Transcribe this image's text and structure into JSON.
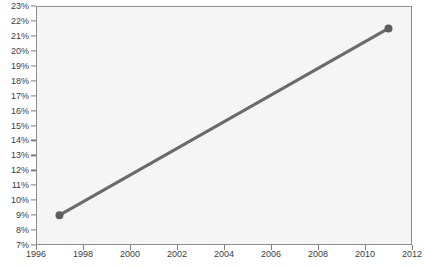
{
  "chart_data": {
    "type": "line",
    "title": "10 YEARS OF MM ACHIEVEMENT",
    "xlabel": "",
    "ylabel": "",
    "x": [
      1997,
      2011
    ],
    "values": [
      9.0,
      21.5
    ],
    "series": [
      {
        "name": "achievement",
        "x": [
          1997,
          2011
        ],
        "values": [
          9.0,
          21.5
        ]
      }
    ],
    "xlim": [
      1996,
      2012
    ],
    "ylim": [
      7,
      23
    ],
    "xticks": [
      1996,
      1998,
      2000,
      2002,
      2004,
      2006,
      2008,
      2010,
      2012
    ],
    "xtick_labels": [
      "1996",
      "1998",
      "2000",
      "2002",
      "2004",
      "2006",
      "2008",
      "2010",
      "2012"
    ],
    "yticks": [
      7,
      8,
      9,
      10,
      11,
      12,
      13,
      14,
      15,
      16,
      17,
      18,
      19,
      20,
      21,
      22,
      23
    ],
    "ytick_labels": [
      "7%",
      "8%",
      "9%",
      "10%",
      "11%",
      "12%",
      "13%",
      "14%",
      "15%",
      "16%",
      "17%",
      "18%",
      "19%",
      "20%",
      "21%",
      "22%",
      "23%"
    ],
    "grid": false,
    "legend": null,
    "colors": {
      "line": "#6a6a6a",
      "marker": "#5e5e5e",
      "axis": "#8d8d8d",
      "tick_text": "#3c3c3c",
      "plot_background": "#f5f5f5",
      "page_background": "#ffffff",
      "title_text": "#4a4a4a"
    },
    "line_width": 3,
    "marker_size": 4,
    "marker_shape": "circle"
  }
}
